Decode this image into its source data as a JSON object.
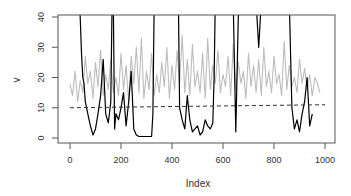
{
  "chart_data": {
    "type": "line",
    "title": "",
    "xlabel": "Index",
    "ylabel": "v",
    "xlim": [
      0,
      1000
    ],
    "ylim": [
      0,
      40
    ],
    "grid": false,
    "legend": null,
    "x_ticks": [
      0,
      200,
      400,
      600,
      800,
      1000
    ],
    "y_ticks": [
      0,
      10,
      20,
      30,
      40
    ],
    "series": [
      {
        "name": "gray series",
        "color": "#bdbdbd",
        "x": [
          0,
          10,
          20,
          30,
          40,
          50,
          60,
          70,
          80,
          90,
          100,
          110,
          120,
          130,
          140,
          150,
          160,
          170,
          180,
          190,
          200,
          210,
          220,
          230,
          240,
          250,
          260,
          270,
          280,
          290,
          300,
          310,
          320,
          330,
          340,
          350,
          360,
          370,
          380,
          390,
          400,
          410,
          420,
          430,
          440,
          450,
          460,
          470,
          480,
          490,
          500,
          510,
          520,
          530,
          540,
          550,
          560,
          570,
          580,
          590,
          600,
          610,
          620,
          630,
          640,
          650,
          660,
          670,
          680,
          690,
          700,
          710,
          720,
          730,
          740,
          750,
          760,
          770,
          780,
          790,
          800,
          810,
          820,
          830,
          840,
          850,
          860,
          870,
          880,
          890,
          900,
          910,
          920,
          930,
          940,
          950,
          960,
          970,
          980
        ],
        "values": [
          18,
          14,
          22,
          12,
          19,
          15,
          27,
          18,
          22,
          13,
          25,
          17,
          29,
          14,
          21,
          16,
          26,
          15,
          20,
          14,
          28,
          16,
          24,
          12,
          27,
          18,
          30,
          15,
          33,
          13,
          22,
          16,
          28,
          14,
          21,
          15,
          25,
          17,
          30,
          13,
          24,
          16,
          29,
          18,
          34,
          15,
          26,
          14,
          31,
          17,
          22,
          15,
          28,
          13,
          33,
          16,
          24,
          18,
          29,
          15,
          21,
          17,
          27,
          14,
          31,
          16,
          25,
          18,
          22,
          13,
          28,
          17,
          24,
          15,
          26,
          14,
          30,
          17,
          22,
          15,
          27,
          18,
          21,
          14,
          32,
          16,
          24,
          17,
          20,
          15,
          26,
          18,
          23,
          16,
          21,
          14,
          20,
          18,
          15
        ]
      },
      {
        "name": "black series",
        "color": "#000000",
        "x": [
          0,
          20,
          30,
          35,
          40,
          45,
          50,
          55,
          60,
          70,
          80,
          90,
          100,
          110,
          120,
          130,
          140,
          150,
          160,
          165,
          170,
          175,
          180,
          190,
          200,
          210,
          220,
          230,
          240,
          250,
          260,
          270,
          300,
          320,
          325,
          330,
          335,
          340,
          350,
          400,
          410,
          415,
          420,
          425,
          430,
          440,
          450,
          460,
          470,
          480,
          490,
          500,
          510,
          520,
          530,
          540,
          550,
          560,
          565,
          570,
          575,
          600,
          620,
          630,
          640,
          650,
          660,
          670,
          680,
          690,
          700,
          710,
          720,
          730,
          740,
          750,
          760,
          780,
          800,
          820,
          830,
          840,
          850,
          860,
          870,
          880,
          890,
          900,
          910,
          920,
          930,
          940,
          950,
          960,
          970
        ],
        "values": [
          null,
          null,
          null,
          45,
          40,
          28,
          20,
          18,
          12,
          8,
          4,
          1,
          3,
          8,
          14,
          26,
          8,
          5,
          12,
          45,
          45,
          3,
          8,
          6,
          10,
          15,
          4,
          12,
          22,
          3,
          1,
          0.5,
          0.5,
          0.5,
          8,
          45,
          45,
          null,
          null,
          null,
          null,
          null,
          45,
          45,
          10,
          6,
          3,
          14,
          6,
          2,
          3,
          4,
          1,
          2,
          6,
          4,
          3,
          5,
          20,
          45,
          45,
          null,
          null,
          45,
          45,
          2,
          40,
          45,
          45,
          null,
          45,
          45,
          45,
          45,
          30,
          45,
          45,
          null,
          null,
          45,
          45,
          45,
          45,
          45,
          10,
          3,
          6,
          2,
          8,
          12,
          20,
          4,
          8,
          null,
          null
        ]
      }
    ],
    "reference_line": {
      "style": "dashed",
      "color": "#333333",
      "x": [
        0,
        1000
      ],
      "y": [
        10,
        11
      ]
    }
  }
}
